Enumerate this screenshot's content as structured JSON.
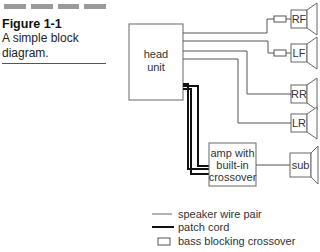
{
  "figure": {
    "number": "Figure 1-1",
    "description_line1": "A simple block",
    "description_line2": "diagram."
  },
  "diagram": {
    "head_unit": {
      "line1": "head",
      "line2": "unit"
    },
    "amp": {
      "line1": "amp with",
      "line2": "built-in",
      "line3": "crossover"
    },
    "speakers": [
      {
        "id": "rf",
        "label": "RF",
        "has_crossover": true
      },
      {
        "id": "lf",
        "label": "LF",
        "has_crossover": true
      },
      {
        "id": "rr",
        "label": "RR",
        "has_crossover": false
      },
      {
        "id": "lr",
        "label": "LR",
        "has_crossover": false
      },
      {
        "id": "sub",
        "label": "sub",
        "has_crossover": false
      }
    ]
  },
  "legend": {
    "items": [
      {
        "symbol": "thin-line",
        "label": "speaker wire pair"
      },
      {
        "symbol": "thick-line",
        "label": "patch cord"
      },
      {
        "symbol": "small-box",
        "label": "bass blocking crossover"
      }
    ]
  },
  "colors": {
    "line": "#555555",
    "patch": "#111111",
    "header_bars": "#9a9a9a"
  }
}
